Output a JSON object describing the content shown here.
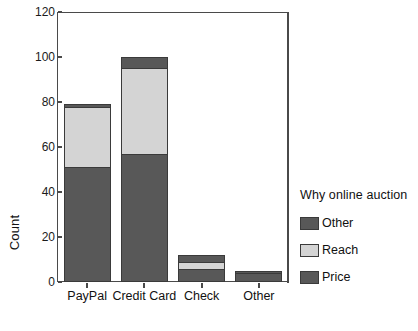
{
  "chart_data": {
    "type": "bar",
    "stacked": true,
    "title": "",
    "xlabel": "",
    "ylabel": "Count",
    "ylim": [
      0,
      120
    ],
    "ytick_values": [
      0,
      20,
      40,
      60,
      80,
      100,
      120
    ],
    "ytick_labels": [
      "0",
      "20",
      "40",
      "60",
      "80",
      "100",
      "120"
    ],
    "grid": false,
    "categories": [
      "PayPal",
      "Credit Card",
      "Check",
      "Other"
    ],
    "series": [
      {
        "name": "Price",
        "color": "#585858",
        "values": [
          51,
          57,
          6,
          4
        ]
      },
      {
        "name": "Reach",
        "color": "#d4d4d4",
        "values": [
          27,
          38,
          3,
          0
        ]
      },
      {
        "name": "Other",
        "color": "#585858",
        "values": [
          1,
          5,
          3,
          1
        ]
      }
    ],
    "totals": [
      79,
      100,
      12,
      5
    ],
    "legend": {
      "title": "Why  online auction",
      "position": "right",
      "entries": [
        {
          "label": "Other",
          "color": "#585858"
        },
        {
          "label": "Reach",
          "color": "#d4d4d4"
        },
        {
          "label": "Price",
          "color": "#585858"
        }
      ]
    }
  }
}
